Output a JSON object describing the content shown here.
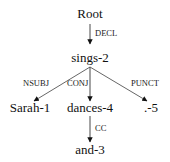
{
  "diagram": {
    "type": "dependency-tree",
    "nodes": {
      "root": "Root",
      "sings": "sings-2",
      "sarah": "Sarah-1",
      "dances": "dances-4",
      "punct": ".-5",
      "and": "and-3"
    },
    "edges": {
      "decl": "DECL",
      "nsubj": "NSUBJ",
      "conj": "CONJ",
      "punct": "PUNCT",
      "cc": "CC"
    }
  }
}
